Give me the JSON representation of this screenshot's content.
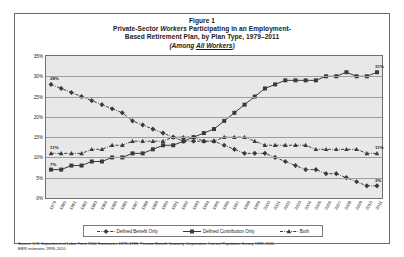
{
  "figure": {
    "title_line1": "Figure 1",
    "title_line2_a": "Private-Sector ",
    "title_line2_b": "Workers",
    "title_line2_c": " Participating in an Employment-",
    "title_line3": "Based Retirement Plan, by Plan Type, 1979–2011",
    "subtitle_a": "(Among ",
    "subtitle_b": "All Workers",
    "subtitle_c": ")"
  },
  "legend": {
    "items": [
      {
        "label": "Defined Benefit Only",
        "marker": "diamond",
        "style": "dash-dot",
        "color": "#3a3a3a"
      },
      {
        "label": "Defined Contribution Only",
        "marker": "square",
        "style": "solid",
        "color": "#3a3a3a"
      },
      {
        "label": "Both",
        "marker": "triangle",
        "style": "dash-dot",
        "color": "#3a3a3a"
      }
    ]
  },
  "source": {
    "line1": "Source: U.S. Department of Labor Form 5500 Summaries 1979–1998, Pension Benefit Guaranty Corporation, Current Population Survey 1999–2011.",
    "line2": "EBRI estimates 1999–2010."
  },
  "chart_data": {
    "type": "line",
    "subtitle": "(Among All Workers)",
    "xlabel": "",
    "ylabel": "",
    "ylim": [
      0,
      35
    ],
    "ytick_labels": [
      "0%",
      "5%",
      "10%",
      "15%",
      "20%",
      "25%",
      "30%",
      "35%"
    ],
    "ytick_values": [
      0,
      5,
      10,
      15,
      20,
      25,
      30,
      35
    ],
    "grid": true,
    "legend_position": "bottom",
    "categories": [
      "1979",
      "1980",
      "1981",
      "1982",
      "1983",
      "1984",
      "1985",
      "1986",
      "1987",
      "1988",
      "1989",
      "1990",
      "1991",
      "1992",
      "1993",
      "1994",
      "1995",
      "1996",
      "1997",
      "1998",
      "1999",
      "2000",
      "2001",
      "2002",
      "2003",
      "2004",
      "2005",
      "2006",
      "2007",
      "2008",
      "2009",
      "2010",
      "2011"
    ],
    "series": [
      {
        "name": "Defined Benefit Only",
        "marker": "diamond",
        "values": [
          28,
          27,
          26,
          25,
          24,
          23,
          22,
          21,
          19,
          18,
          17,
          16,
          15,
          14,
          14,
          14,
          14,
          13,
          12,
          11,
          11,
          11,
          10,
          9,
          8,
          7,
          7,
          6,
          6,
          5,
          4,
          3,
          3
        ]
      },
      {
        "name": "Defined Contribution Only",
        "marker": "square",
        "values": [
          7,
          7,
          8,
          8,
          9,
          9,
          10,
          10,
          11,
          11,
          12,
          13,
          13,
          14,
          15,
          16,
          17,
          19,
          21,
          23,
          25,
          27,
          28,
          29,
          29,
          29,
          29,
          30,
          30,
          31,
          30,
          30,
          31
        ]
      },
      {
        "name": "Both",
        "marker": "triangle",
        "values": [
          11,
          11,
          11,
          11,
          12,
          12,
          13,
          13,
          14,
          14,
          14,
          14,
          15,
          15,
          15,
          14,
          14,
          15,
          15,
          15,
          14,
          13,
          13,
          13,
          13,
          13,
          12,
          12,
          12,
          12,
          12,
          11,
          11
        ]
      }
    ],
    "point_labels": [
      {
        "series": "Defined Benefit Only",
        "category": "1979",
        "text": "28%"
      },
      {
        "series": "Defined Contribution Only",
        "category": "1979",
        "text": "7%"
      },
      {
        "series": "Both",
        "category": "1979",
        "text": "11%"
      },
      {
        "series": "Defined Contribution Only",
        "category": "2011",
        "text": "31%"
      },
      {
        "series": "Both",
        "category": "2011",
        "text": "11%"
      },
      {
        "series": "Defined Benefit Only",
        "category": "2011",
        "text": "3%"
      }
    ]
  }
}
